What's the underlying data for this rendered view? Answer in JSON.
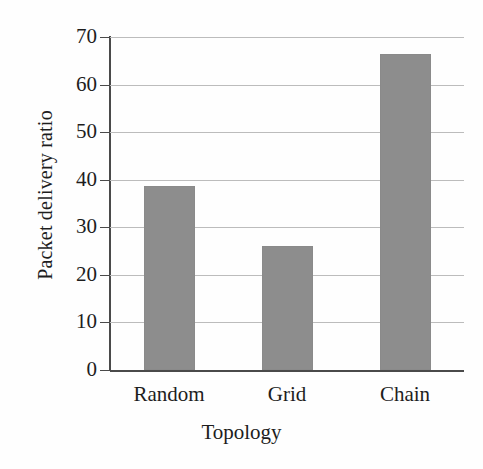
{
  "chart_data": {
    "type": "bar",
    "title": "",
    "subtitle": "",
    "xlabel": "Topology",
    "ylabel": "Packet delivery ratio",
    "categories": [
      "Random",
      "Grid",
      "Chain"
    ],
    "values": [
      38.6,
      26.0,
      66.5
    ],
    "series": [
      {
        "name": "Packet delivery ratio",
        "values": [
          38.6,
          26.0,
          66.5
        ]
      }
    ],
    "ylim": [
      0,
      70
    ],
    "xlim": [
      0,
      3
    ],
    "yticks": [
      0,
      10,
      20,
      30,
      40,
      50,
      60,
      70
    ],
    "ytick_labels": [
      "0",
      "10",
      "20",
      "30",
      "40",
      "50",
      "60",
      "70"
    ],
    "grid": true,
    "grid_axis": "y",
    "legend": false,
    "legend_position": "none",
    "bar_color": "#8d8d8d",
    "gridline_color": "#bcbcbc",
    "axis_color": "#4a4a4a",
    "background_color": "#ffffff"
  },
  "axes": {
    "y_title": "Packet delivery ratio",
    "x_title": "Topology"
  }
}
